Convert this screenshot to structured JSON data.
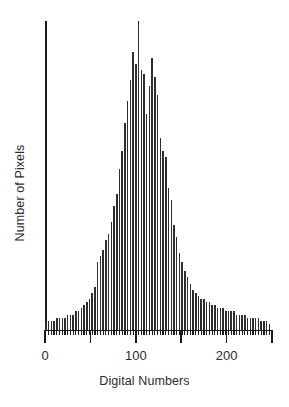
{
  "chart_data": {
    "type": "bar",
    "title": "",
    "subtitle": "",
    "xlabel": "Digital Numbers",
    "ylabel": "Number of Pixels",
    "xlim": [
      0,
      251
    ],
    "ylim": [
      0,
      100
    ],
    "grid": false,
    "legend": null,
    "annotations": [],
    "axis_color": "#1a1a1a",
    "bar_color": "#2e2e2e",
    "background_color": "#ffffff",
    "xticks": [
      0,
      50,
      100,
      150,
      200,
      250
    ],
    "xtick_labels": [
      "0",
      "",
      "100",
      "",
      "200",
      ""
    ],
    "ytick_labels": [],
    "bar_width_dn": 1,
    "note": "Values are relative pixel counts (percent of the maximum bin) read off the spike heights.",
    "categories": [
      1,
      4,
      7,
      10,
      13,
      16,
      19,
      22,
      25,
      28,
      31,
      34,
      37,
      40,
      43,
      46,
      49,
      52,
      55,
      58,
      61,
      64,
      67,
      70,
      73,
      76,
      79,
      82,
      85,
      88,
      91,
      94,
      97,
      100,
      103,
      106,
      109,
      112,
      115,
      118,
      121,
      124,
      127,
      130,
      133,
      136,
      139,
      142,
      145,
      148,
      151,
      154,
      157,
      160,
      163,
      166,
      169,
      172,
      175,
      178,
      181,
      184,
      187,
      190,
      193,
      196,
      199,
      202,
      205,
      208,
      211,
      214,
      217,
      220,
      223,
      226,
      229,
      232,
      235,
      238,
      241,
      244,
      247
    ],
    "values": [
      3,
      3,
      3,
      3,
      4,
      4,
      4,
      4,
      5,
      5,
      5,
      6,
      6,
      7,
      8,
      9,
      10,
      12,
      14,
      22,
      24,
      26,
      29,
      31,
      35,
      40,
      44,
      52,
      58,
      67,
      74,
      81,
      90,
      86,
      100,
      84,
      83,
      70,
      79,
      88,
      82,
      76,
      62,
      58,
      56,
      46,
      42,
      34,
      30,
      25,
      22,
      19,
      17,
      15,
      13,
      12,
      11,
      10,
      10,
      9,
      9,
      8,
      8,
      7,
      7,
      7,
      6,
      6,
      6,
      6,
      5,
      5,
      5,
      5,
      4,
      4,
      4,
      4,
      4,
      3,
      3,
      3,
      2
    ]
  },
  "figure": {
    "xlabel": "Digital Numbers",
    "ylabel": "Number of Pixels"
  }
}
